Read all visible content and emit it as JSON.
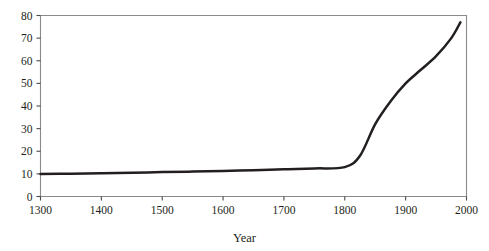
{
  "chart_data": {
    "type": "line",
    "title": "",
    "subtitle": "",
    "xlabel": "Year",
    "ylabel": "",
    "xlim": [
      1300,
      2000
    ],
    "ylim": [
      0,
      80
    ],
    "grid": false,
    "legend": false,
    "legend_position": "none",
    "x_ticks": [
      1300,
      1400,
      1500,
      1600,
      1700,
      1800,
      1900,
      2000
    ],
    "x_tick_labels": [
      "1300",
      "1400",
      "1500",
      "1600",
      "1700",
      "1800",
      "1900",
      "2000"
    ],
    "y_ticks": [
      0,
      10,
      20,
      30,
      40,
      50,
      60,
      70,
      80
    ],
    "y_tick_labels": [
      "0",
      "10",
      "20",
      "30",
      "40",
      "50",
      "60",
      "70",
      "80"
    ],
    "series": [
      {
        "name": "population",
        "color": "#231f20",
        "line_width": 2.5,
        "x": [
          1300,
          1350,
          1400,
          1450,
          1500,
          1550,
          1600,
          1650,
          1700,
          1750,
          1800,
          1825,
          1850,
          1875,
          1900,
          1925,
          1950,
          1975,
          1990
        ],
        "values": [
          10.0,
          10.1,
          10.3,
          10.5,
          10.8,
          11.0,
          11.3,
          11.6,
          12.0,
          12.4,
          13.0,
          18.0,
          32.0,
          42.0,
          50.0,
          56.0,
          62.0,
          70.0,
          77.0
        ]
      }
    ],
    "annotations": []
  },
  "axes": {
    "frame_color": "#8a8a8a",
    "tick_color": "#4a4a4a",
    "x_axis_title": "Year"
  },
  "figure": {
    "background": "#ffffff",
    "width": 489,
    "height": 251
  }
}
